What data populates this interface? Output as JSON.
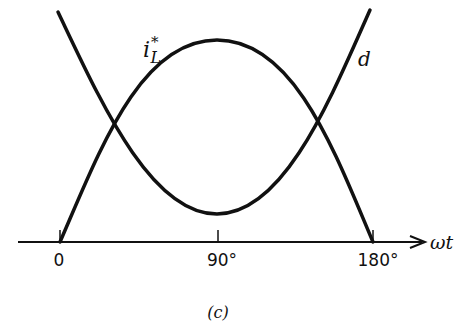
{
  "figure": {
    "caption": "(c)",
    "axis": {
      "label": "ωt",
      "ticks": [
        "0",
        "90°",
        "180°"
      ]
    },
    "curves": [
      {
        "name": "i_L*",
        "label_base": "i",
        "label_sub": "L",
        "label_sup": "*",
        "shape": "half-sine hump, zero at 0 and 180°, peak at 90°"
      },
      {
        "name": "d",
        "label": "d",
        "shape": "U-shaped, high at 0 and 180°, minimum at 90°"
      }
    ],
    "colors": {
      "stroke": "#111111",
      "background": "#ffffff"
    }
  }
}
